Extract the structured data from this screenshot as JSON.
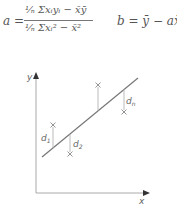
{
  "formulas": {
    "a": {
      "lhs": "a =",
      "numerator": "¹⁄ₙ Σxᵢyᵢ − x̄ȳ",
      "denominator": "¹⁄ₙ Σxᵢ² − x̄²"
    },
    "b": "b = ȳ − ax̄"
  },
  "diagram": {
    "axis_labels": {
      "x": "x",
      "y": "y"
    },
    "residual_labels": {
      "d1": "d",
      "d1_sub": "1",
      "d2": "d",
      "d2_sub": "2",
      "dn": "d",
      "dn_sub": "n"
    },
    "colors": {
      "line": "#777777",
      "axis": "#999999",
      "marker": "#888888"
    }
  }
}
